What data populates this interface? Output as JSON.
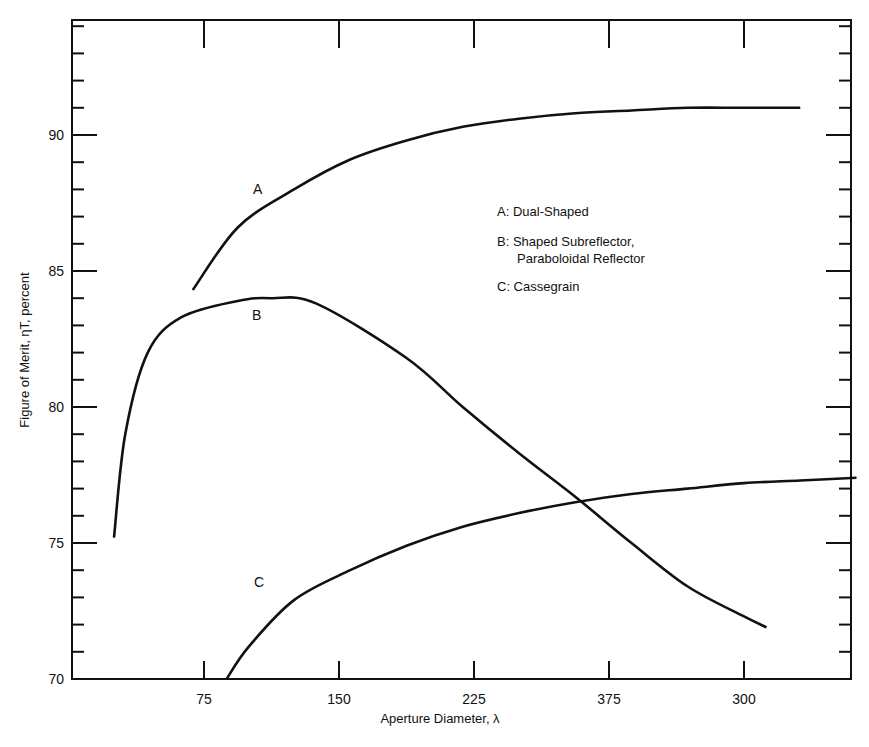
{
  "chart_data": {
    "type": "line",
    "title": "",
    "xlabel": "Aperture Diameter, λ",
    "ylabel": "Figure of Merit, ηT, percent",
    "ylim": [
      70,
      95
    ],
    "x_tick_labels": [
      "75",
      "150",
      "225",
      "375",
      "300"
    ],
    "y_tick_labels": [
      "70",
      "75",
      "80",
      "85",
      "90"
    ],
    "grid": false,
    "legend_position": "upper right (inside plot)",
    "legend": [
      {
        "key": "A",
        "text": "A: Dual-Shaped"
      },
      {
        "key": "B",
        "text": "B: Shaped Subreflector,",
        "text2": "Paraboloidal Reflector"
      },
      {
        "key": "C",
        "text": "C: Cassegrain"
      }
    ],
    "series": [
      {
        "name": "A",
        "label": "A: Dual-Shaped",
        "x": [
          55,
          75,
          100,
          125,
          150,
          175,
          200,
          225,
          250,
          275,
          300,
          325
        ],
        "y": [
          84.3,
          86.6,
          88.0,
          89.1,
          89.8,
          90.3,
          90.6,
          90.8,
          90.9,
          91.0,
          91.0,
          91.0
        ]
      },
      {
        "name": "B",
        "label": "B: Shaped Subreflector, Paraboloidal Reflector",
        "x": [
          20,
          25,
          35,
          50,
          75,
          90,
          110,
          150,
          175,
          200,
          225,
          250,
          275,
          300,
          310
        ],
        "y": [
          75.2,
          79.0,
          82.0,
          83.3,
          83.9,
          84.0,
          83.8,
          81.8,
          80.0,
          78.3,
          76.7,
          75.0,
          73.4,
          72.3,
          71.9
        ]
      },
      {
        "name": "C",
        "label": "C: Cassegrain",
        "x": [
          70,
          80,
          100,
          125,
          150,
          175,
          200,
          225,
          250,
          275,
          300,
          325,
          350
        ],
        "y": [
          70.0,
          71.2,
          72.9,
          74.0,
          74.9,
          75.6,
          76.1,
          76.5,
          76.8,
          77.0,
          77.2,
          77.3,
          77.4
        ]
      }
    ]
  },
  "plot": {
    "curve_label_a": "A",
    "curve_label_b": "B",
    "curve_label_c": "C"
  }
}
